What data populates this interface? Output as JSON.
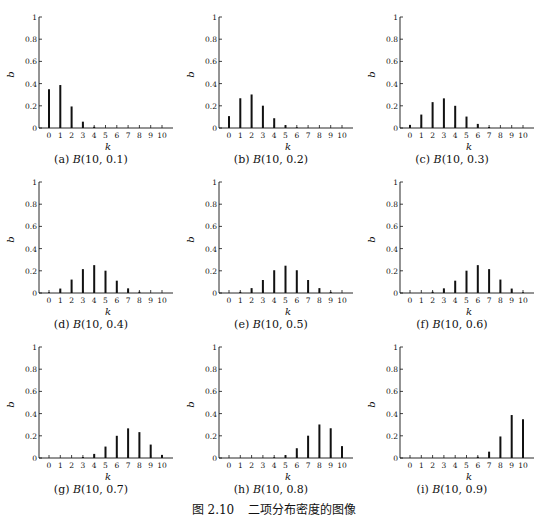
{
  "figure": {
    "number": "图 2.10",
    "title": "二项分布密度的图像"
  },
  "chart_data": [
    {
      "type": "bar",
      "panel": "a",
      "caption": "(a) B(10, 0.1)",
      "caption_prefix": "(a)",
      "caption_math": "B(10, 0.1)",
      "xlabel": "k",
      "ylabel": "b",
      "ylim": [
        0,
        1
      ],
      "yticks": [
        "0",
        "0.2",
        "0.4",
        "0.6",
        "0.8",
        "1"
      ],
      "categories": [
        "0",
        "1",
        "2",
        "3",
        "4",
        "5",
        "6",
        "7",
        "8",
        "9",
        "10"
      ],
      "values": [
        0.349,
        0.387,
        0.194,
        0.057,
        0.011,
        0.001,
        0.0,
        0.0,
        0.0,
        0.0,
        0.0
      ]
    },
    {
      "type": "bar",
      "panel": "b",
      "caption": "(b) B(10, 0.2)",
      "caption_prefix": "(b)",
      "caption_math": "B(10, 0.2)",
      "xlabel": "k",
      "ylabel": "b",
      "ylim": [
        0,
        1
      ],
      "yticks": [
        "0",
        "0.2",
        "0.4",
        "0.6",
        "0.8",
        "1"
      ],
      "categories": [
        "0",
        "1",
        "2",
        "3",
        "4",
        "5",
        "6",
        "7",
        "8",
        "9",
        "10"
      ],
      "values": [
        0.107,
        0.268,
        0.302,
        0.201,
        0.088,
        0.026,
        0.006,
        0.001,
        0.0,
        0.0,
        0.0
      ]
    },
    {
      "type": "bar",
      "panel": "c",
      "caption": "(c) B(10, 0.3)",
      "caption_prefix": "(c)",
      "caption_math": "B(10, 0.3)",
      "xlabel": "k",
      "ylabel": "b",
      "ylim": [
        0,
        1
      ],
      "yticks": [
        "0",
        "0.2",
        "0.4",
        "0.6",
        "0.8",
        "1"
      ],
      "categories": [
        "0",
        "1",
        "2",
        "3",
        "4",
        "5",
        "6",
        "7",
        "8",
        "9",
        "10"
      ],
      "values": [
        0.028,
        0.121,
        0.233,
        0.267,
        0.2,
        0.103,
        0.037,
        0.009,
        0.001,
        0.0,
        0.0
      ]
    },
    {
      "type": "bar",
      "panel": "d",
      "caption": "(d) B(10, 0.4)",
      "caption_prefix": "(d)",
      "caption_math": "B(10, 0.4)",
      "xlabel": "k",
      "ylabel": "b",
      "ylim": [
        0,
        1
      ],
      "yticks": [
        "0",
        "0.2",
        "0.4",
        "0.6",
        "0.8",
        "1"
      ],
      "categories": [
        "0",
        "1",
        "2",
        "3",
        "4",
        "5",
        "6",
        "7",
        "8",
        "9",
        "10"
      ],
      "values": [
        0.006,
        0.04,
        0.121,
        0.215,
        0.251,
        0.201,
        0.111,
        0.042,
        0.011,
        0.002,
        0.0
      ]
    },
    {
      "type": "bar",
      "panel": "e",
      "caption": "(e) B(10, 0.5)",
      "caption_prefix": "(e)",
      "caption_math": "B(10, 0.5)",
      "xlabel": "k",
      "ylabel": "b",
      "ylim": [
        0,
        1
      ],
      "yticks": [
        "0",
        "0.2",
        "0.4",
        "0.6",
        "0.8",
        "1"
      ],
      "categories": [
        "0",
        "1",
        "2",
        "3",
        "4",
        "5",
        "6",
        "7",
        "8",
        "9",
        "10"
      ],
      "values": [
        0.001,
        0.01,
        0.044,
        0.117,
        0.205,
        0.246,
        0.205,
        0.117,
        0.044,
        0.01,
        0.001
      ]
    },
    {
      "type": "bar",
      "panel": "f",
      "caption": "(f) B(10, 0.6)",
      "caption_prefix": "(f)",
      "caption_math": "B(10, 0.6)",
      "xlabel": "k",
      "ylabel": "b",
      "ylim": [
        0,
        1
      ],
      "yticks": [
        "0",
        "0.2",
        "0.4",
        "0.6",
        "0.8",
        "1"
      ],
      "categories": [
        "0",
        "1",
        "2",
        "3",
        "4",
        "5",
        "6",
        "7",
        "8",
        "9",
        "10"
      ],
      "values": [
        0.0,
        0.002,
        0.011,
        0.042,
        0.111,
        0.201,
        0.251,
        0.215,
        0.121,
        0.04,
        0.006
      ]
    },
    {
      "type": "bar",
      "panel": "g",
      "caption": "(g) B(10, 0.7)",
      "caption_prefix": "(g)",
      "caption_math": "B(10, 0.7)",
      "xlabel": "k",
      "ylabel": "b",
      "ylim": [
        0,
        1
      ],
      "yticks": [
        "0",
        "0.2",
        "0.4",
        "0.6",
        "0.8",
        "1"
      ],
      "categories": [
        "0",
        "1",
        "2",
        "3",
        "4",
        "5",
        "6",
        "7",
        "8",
        "9",
        "10"
      ],
      "values": [
        0.0,
        0.0,
        0.001,
        0.009,
        0.037,
        0.103,
        0.2,
        0.267,
        0.233,
        0.121,
        0.028
      ]
    },
    {
      "type": "bar",
      "panel": "h",
      "caption": "(h) B(10, 0.8)",
      "caption_prefix": "(h)",
      "caption_math": "B(10, 0.8)",
      "xlabel": "k",
      "ylabel": "b",
      "ylim": [
        0,
        1
      ],
      "yticks": [
        "0",
        "0.2",
        "0.4",
        "0.6",
        "0.8",
        "1"
      ],
      "categories": [
        "0",
        "1",
        "2",
        "3",
        "4",
        "5",
        "6",
        "7",
        "8",
        "9",
        "10"
      ],
      "values": [
        0.0,
        0.0,
        0.0,
        0.001,
        0.006,
        0.026,
        0.088,
        0.201,
        0.302,
        0.268,
        0.107
      ]
    },
    {
      "type": "bar",
      "panel": "i",
      "caption": "(i) B(10, 0.9)",
      "caption_prefix": "(i)",
      "caption_math": "B(10, 0.9)",
      "xlabel": "k",
      "ylabel": "b",
      "ylim": [
        0,
        1
      ],
      "yticks": [
        "0",
        "0.2",
        "0.4",
        "0.6",
        "0.8",
        "1"
      ],
      "categories": [
        "0",
        "1",
        "2",
        "3",
        "4",
        "5",
        "6",
        "7",
        "8",
        "9",
        "10"
      ],
      "values": [
        0.0,
        0.0,
        0.0,
        0.0,
        0.0,
        0.001,
        0.011,
        0.057,
        0.194,
        0.387,
        0.349
      ]
    }
  ]
}
